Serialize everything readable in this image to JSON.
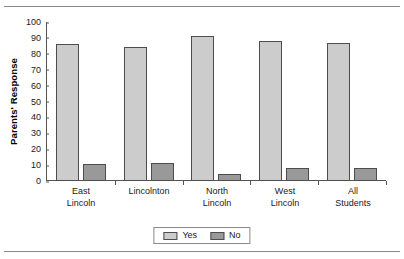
{
  "chart_data": {
    "type": "bar",
    "title": "",
    "xlabel": "",
    "ylabel": "Parents' Response",
    "ylim": [
      0,
      100
    ],
    "ytick_step": 10,
    "yticks": [
      100,
      90,
      80,
      70,
      60,
      50,
      40,
      30,
      20,
      10,
      0
    ],
    "grid": false,
    "legend_position": "bottom-center",
    "categories": [
      "East Lincoln",
      "Lincolnton",
      "North Lincoln",
      "West Lincoln",
      "All Students"
    ],
    "category_lines": [
      [
        "East",
        "Lincoln"
      ],
      [
        "Lincolnton",
        ""
      ],
      [
        "North",
        "Lincoln"
      ],
      [
        "West",
        "Lincoln"
      ],
      [
        "All",
        "Students"
      ]
    ],
    "series": [
      {
        "name": "Yes",
        "color": "#cccccc",
        "values": [
          86,
          84,
          91,
          88,
          87
        ]
      },
      {
        "name": "No",
        "color": "#999999",
        "values": [
          11,
          11.5,
          4.5,
          8,
          8.5
        ]
      }
    ]
  },
  "legend": {
    "items": [
      {
        "label": "Yes",
        "swatch": "yes"
      },
      {
        "label": "No",
        "swatch": "no"
      }
    ]
  }
}
